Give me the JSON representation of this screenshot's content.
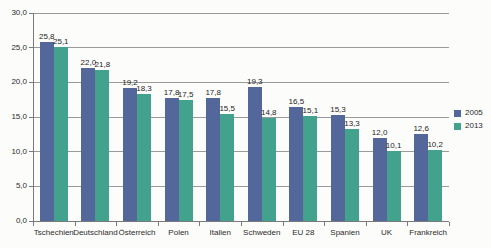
{
  "chart_data": {
    "type": "bar",
    "title": "",
    "xlabel": "",
    "ylabel": "",
    "categories": [
      "Tschechien",
      "Deutschland",
      "Österreich",
      "Polen",
      "Italien",
      "Schweden",
      "EU 28",
      "Spanien",
      "UK",
      "Frankreich"
    ],
    "series": [
      {
        "name": "2005",
        "color": "#53679B",
        "values": [
          25.8,
          22.0,
          19.2,
          17.8,
          17.8,
          19.3,
          16.5,
          15.3,
          12.0,
          12.6
        ],
        "value_labels": [
          "25,8",
          "22,0",
          "19,2",
          "17,8",
          "17,8",
          "19,3",
          "16,5",
          "15,3",
          "12,0",
          "12,6"
        ]
      },
      {
        "name": "2013",
        "color": "#43A28D",
        "values": [
          25.1,
          21.8,
          18.3,
          17.5,
          15.5,
          14.8,
          15.1,
          13.3,
          10.1,
          10.2
        ],
        "value_labels": [
          "25,1",
          "21,8",
          "18,3",
          "17,5",
          "15,5",
          "14,8",
          "15,1",
          "13,3",
          "10,1",
          "10,2"
        ]
      }
    ],
    "ylim": [
      0,
      30
    ],
    "ytick_step": 5,
    "ytick_labels": [
      "0,0",
      "5,0",
      "10,0",
      "15,0",
      "20,0",
      "25,0",
      "30,0"
    ],
    "grid": true,
    "legend_position": "right"
  },
  "legend": {
    "items": [
      {
        "label": "2005",
        "color": "#53679B"
      },
      {
        "label": "2013",
        "color": "#43A28D"
      }
    ]
  }
}
